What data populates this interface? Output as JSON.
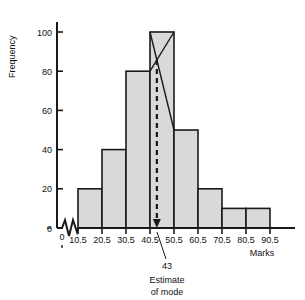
{
  "chart_data": {
    "type": "bar",
    "title": "",
    "subtitle": "",
    "xlabel": "Marks",
    "ylabel": "Frequency",
    "categories": [
      "10.5-20.5",
      "20.5-30.5",
      "30.5-40.5",
      "40.5-50.5",
      "50.5-60.5",
      "60.5-70.5",
      "70.5-80.5",
      "80.5-90.5"
    ],
    "bin_edges": [
      10.5,
      20.5,
      30.5,
      40.5,
      50.5,
      60.5,
      70.5,
      80.5,
      90.5
    ],
    "values": [
      20,
      40,
      80,
      100,
      50,
      20,
      10,
      10
    ],
    "xlim": [
      10.5,
      90.5
    ],
    "ylim": [
      0,
      100
    ],
    "xticks": [
      "0",
      "10.5",
      "20.5",
      "30.5",
      "40.5",
      "50.5",
      "60.5",
      "70.5",
      "80.5",
      "90.5"
    ],
    "yticks": [
      "0",
      "20",
      "40",
      "60",
      "80",
      "100"
    ],
    "grid": false,
    "legend": false,
    "axis_break": true,
    "bar_fill": "#d9d9d9",
    "bar_stroke": "#1a1a1a",
    "annotations": {
      "mode_value": "43",
      "mode_caption_line1": "Estimate",
      "mode_caption_line2": "of mode",
      "mode_marker_x": 43,
      "modal_bin_index": 3
    }
  },
  "axis": {
    "y_label": "Frequency",
    "x_label": "Marks",
    "zero_label": "0"
  }
}
